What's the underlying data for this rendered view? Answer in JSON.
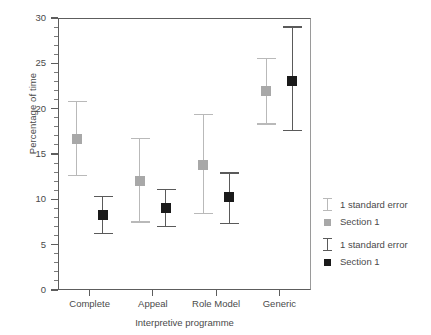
{
  "chart_data": {
    "type": "scatter",
    "title": "",
    "xlabel": "Interpretive programme",
    "ylabel": "Percentage of time",
    "categories": [
      "Complete",
      "Appeal",
      "Role Model",
      "Generic"
    ],
    "ylim": [
      0,
      30
    ],
    "yticks": [
      0,
      5,
      10,
      15,
      20,
      25,
      30
    ],
    "ytick_labels": [
      "0",
      "5",
      "10",
      "15",
      "20",
      "25",
      "30"
    ],
    "y_minor_tick_interval": 1,
    "grid": false,
    "legend_position": "right",
    "series": [
      {
        "name": "Section 1",
        "color": "#a8a8a8",
        "error_label": "1 standard error",
        "error_color": "#b9b9b9",
        "values": [
          16.7,
          12.0,
          13.8,
          22.0
        ],
        "error_low": [
          12.6,
          7.5,
          8.4,
          18.3
        ],
        "error_high": [
          20.8,
          16.7,
          19.4,
          25.5
        ]
      },
      {
        "name": "Section 1",
        "color": "#1a1a1a",
        "error_label": "1 standard error",
        "error_color": "#5a5a5a",
        "values": [
          8.3,
          9.0,
          10.3,
          23.1
        ],
        "error_low": [
          6.2,
          7.0,
          7.3,
          17.6
        ],
        "error_high": [
          10.3,
          11.1,
          12.9,
          29.0
        ]
      }
    ],
    "legend": [
      {
        "label": "1 standard error",
        "kind": "errorbar",
        "color": "#b9b9b9"
      },
      {
        "label": "Section 1",
        "kind": "square",
        "color": "#a8a8a8"
      },
      {
        "label": "1 standard error",
        "kind": "errorbar",
        "color": "#5a5a5a"
      },
      {
        "label": "Section 1",
        "kind": "square",
        "color": "#1a1a1a"
      }
    ]
  }
}
